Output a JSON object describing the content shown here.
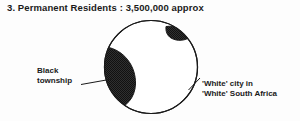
{
  "figure": {
    "title": "3. Permanent Residents : 3,500,000 approx",
    "labels": {
      "black_township": {
        "line1": "Black",
        "line2": "township"
      },
      "white_city": {
        "line1": "'White' city in",
        "line2": "'White' South Africa"
      }
    },
    "colors": {
      "background": "#fdfdfd",
      "ink": "#1a1a1a",
      "shaded_region": "#2f2f2f",
      "unshaded_region": "#ffffff",
      "outline": "#1a1a1a"
    },
    "diagram": {
      "type": "schematic-circle",
      "circle": {
        "center_x": 151,
        "center_y": 67,
        "radius": 47
      },
      "regions": [
        {
          "name": "black-township-large",
          "fill": "shaded",
          "position": "left",
          "shape": "lens"
        },
        {
          "name": "black-township-small",
          "fill": "shaded",
          "position": "upper-right",
          "shape": "lens"
        },
        {
          "name": "white-city",
          "fill": "unshaded",
          "position": "center",
          "shape": "circle-remainder"
        }
      ],
      "leaders": [
        {
          "name": "leader-black-township",
          "from_x": 82,
          "from_y": 84,
          "to_x": 112,
          "to_y": 79
        },
        {
          "name": "leader-white-city",
          "from_x": 188,
          "from_y": 90,
          "to_x": 199,
          "to_y": 79
        }
      ]
    }
  }
}
